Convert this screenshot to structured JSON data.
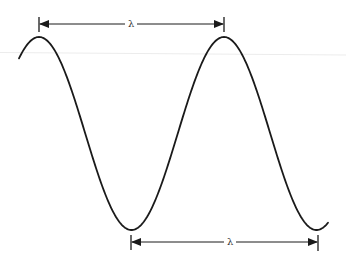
{
  "diagram": {
    "type": "sine-wave-wavelength",
    "stroke_color": "#1a1a1a",
    "wave": {
      "start": [
        19,
        62
      ],
      "peaks": [
        [
          39,
          37
        ],
        [
          224,
          37
        ]
      ],
      "troughs": [
        [
          131,
          230
        ],
        [
          318,
          229
        ]
      ],
      "end": [
        328,
        225
      ]
    },
    "dimensions": [
      {
        "label": "λ",
        "from_x": 39,
        "to_x": 224,
        "y": 24,
        "label_x": 130,
        "description": "wavelength measured peak to peak"
      },
      {
        "label": "λ",
        "from_x": 131,
        "to_x": 318,
        "y": 242,
        "label_x": 229,
        "description": "wavelength measured trough to trough"
      }
    ]
  }
}
